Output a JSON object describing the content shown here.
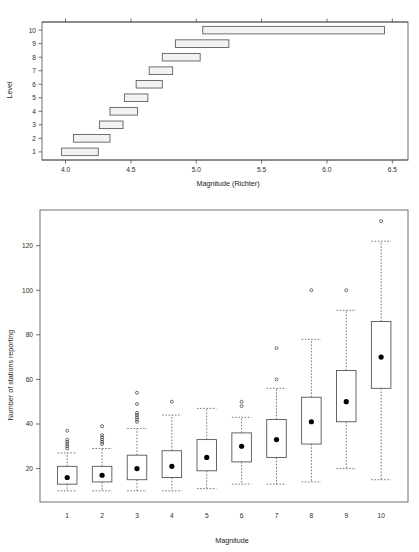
{
  "page": {
    "width": 419,
    "height": 552,
    "background": "#ffffff"
  },
  "chart_data": [
    {
      "id": "magnitude-by-level",
      "type": "bar",
      "orientation": "horizontal",
      "title": "",
      "xlabel": "Magnitude (Richter)",
      "ylabel": "Level",
      "xlim": [
        3.82,
        6.62
      ],
      "xticks": [
        4.0,
        4.5,
        5.0,
        5.5,
        6.0,
        6.5
      ],
      "xticklabels": [
        "4.0",
        "4.5",
        "5.0",
        "5.5",
        "6.0",
        "6.5"
      ],
      "ylim": [
        0.4,
        10.6
      ],
      "yticks": [
        1,
        2,
        3,
        4,
        5,
        6,
        7,
        8,
        9,
        10
      ],
      "yticklabels": [
        "1",
        "2",
        "3",
        "4",
        "5",
        "6",
        "7",
        "8",
        "9",
        "10"
      ],
      "grid": false,
      "legend": null,
      "bar_fill": "#f2f2f2",
      "bar_stroke": "#4d4d4d",
      "categories": [
        "1",
        "2",
        "3",
        "4",
        "5",
        "6",
        "7",
        "8",
        "9",
        "10"
      ],
      "intervals": [
        {
          "level": 1,
          "start": 3.97,
          "end": 4.25
        },
        {
          "level": 2,
          "start": 4.06,
          "end": 4.34
        },
        {
          "level": 3,
          "start": 4.26,
          "end": 4.44
        },
        {
          "level": 4,
          "start": 4.34,
          "end": 4.55
        },
        {
          "level": 5,
          "start": 4.45,
          "end": 4.63
        },
        {
          "level": 6,
          "start": 4.54,
          "end": 4.74
        },
        {
          "level": 7,
          "start": 4.64,
          "end": 4.82
        },
        {
          "level": 8,
          "start": 4.74,
          "end": 5.03
        },
        {
          "level": 9,
          "start": 4.84,
          "end": 5.25
        },
        {
          "level": 10,
          "start": 5.05,
          "end": 6.44
        }
      ]
    },
    {
      "id": "stations-by-magnitude",
      "type": "boxplot",
      "title": "",
      "xlabel": "Magnitude",
      "ylabel": "Number of stations reporting",
      "xticks": [
        1,
        2,
        3,
        4,
        5,
        6,
        7,
        8,
        9,
        10
      ],
      "xticklabels": [
        "1",
        "2",
        "3",
        "4",
        "5",
        "6",
        "7",
        "8",
        "9",
        "10"
      ],
      "ylim": [
        5,
        136
      ],
      "yticks": [
        20,
        40,
        60,
        80,
        100,
        120
      ],
      "yticklabels": [
        "20",
        "40",
        "60",
        "80",
        "100",
        "120"
      ],
      "grid": false,
      "legend": null,
      "median_marker": "filled-circle",
      "whisker_style": "dashed",
      "boxes": [
        {
          "category": "1",
          "lower_whisker": 10,
          "q1": 13,
          "median": 16,
          "q3": 21,
          "upper_whisker": 27,
          "outliers": [
            29,
            30,
            31,
            32,
            33,
            37
          ]
        },
        {
          "category": "2",
          "lower_whisker": 10,
          "q1": 14,
          "median": 17,
          "q3": 21,
          "upper_whisker": 29,
          "outliers": [
            31,
            32,
            33,
            34,
            35,
            39
          ]
        },
        {
          "category": "3",
          "lower_whisker": 10,
          "q1": 15,
          "median": 20,
          "q3": 26,
          "upper_whisker": 38,
          "outliers": [
            41,
            42,
            43,
            44,
            45,
            49,
            54
          ]
        },
        {
          "category": "4",
          "lower_whisker": 10,
          "q1": 16,
          "median": 21,
          "q3": 28,
          "upper_whisker": 44,
          "outliers": [
            50
          ]
        },
        {
          "category": "5",
          "lower_whisker": 11,
          "q1": 19,
          "median": 25,
          "q3": 33,
          "upper_whisker": 47,
          "outliers": []
        },
        {
          "category": "6",
          "lower_whisker": 13,
          "q1": 23,
          "median": 30,
          "q3": 36,
          "upper_whisker": 43,
          "outliers": [
            48,
            50
          ]
        },
        {
          "category": "7",
          "lower_whisker": 13,
          "q1": 25,
          "median": 33,
          "q3": 42,
          "upper_whisker": 56,
          "outliers": [
            60,
            74
          ]
        },
        {
          "category": "8",
          "lower_whisker": 14,
          "q1": 31,
          "median": 41,
          "q3": 52,
          "upper_whisker": 78,
          "outliers": [
            100
          ]
        },
        {
          "category": "9",
          "lower_whisker": 20,
          "q1": 41,
          "median": 50,
          "q3": 64,
          "upper_whisker": 91,
          "outliers": [
            100
          ]
        },
        {
          "category": "10",
          "lower_whisker": 15,
          "q1": 56,
          "median": 70,
          "q3": 86,
          "upper_whisker": 122,
          "outliers": [
            131
          ]
        }
      ]
    }
  ]
}
